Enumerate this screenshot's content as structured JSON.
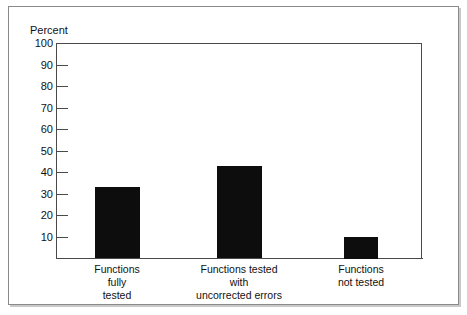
{
  "chart_data": {
    "type": "bar",
    "title": "",
    "subtitle": "",
    "xlabel": "",
    "ylabel": "Percent",
    "ylim": [
      0,
      100
    ],
    "grid": false,
    "legend": false,
    "orientation": "vertical",
    "bar_color": "#0d0d0d",
    "categories": [
      "Functions\nfully\ntested",
      "Functions tested\nwith\nuncorrected errors",
      "Functions\nnot tested"
    ],
    "category_lines": [
      [
        "Functions",
        "fully",
        "tested"
      ],
      [
        "Functions tested",
        "with",
        "uncorrected errors"
      ],
      [
        "Functions",
        "not tested"
      ]
    ],
    "values": [
      33,
      43,
      10
    ],
    "ytick_labels": [
      "100",
      "90",
      "80",
      "70",
      "60",
      "50",
      "40",
      "30",
      "20",
      "10"
    ],
    "ytick_values": [
      100,
      90,
      80,
      70,
      60,
      50,
      40,
      30,
      20,
      10
    ],
    "ytick_count": 10
  },
  "axis": {
    "y_title": "Percent"
  }
}
